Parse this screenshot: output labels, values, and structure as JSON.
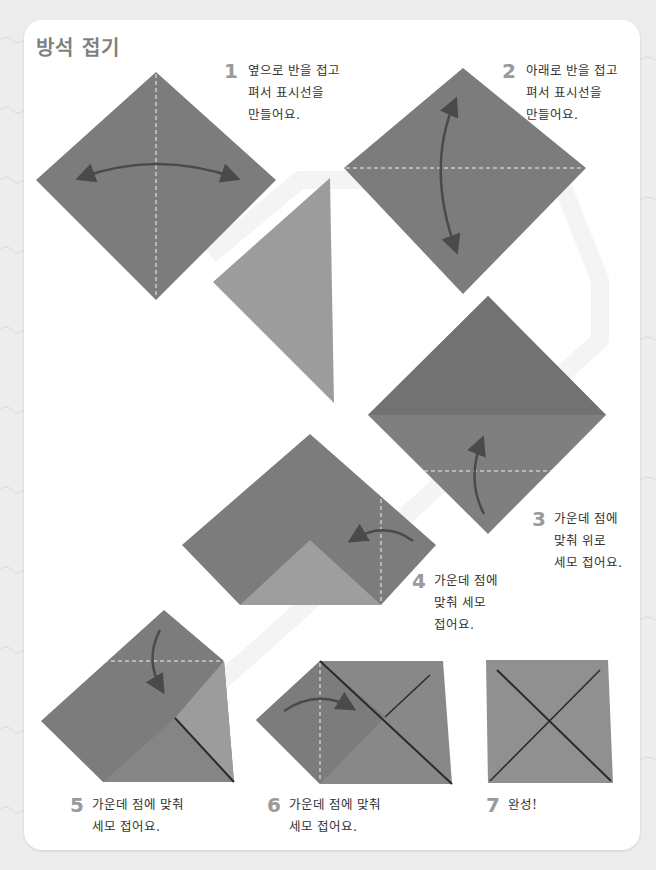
{
  "page": {
    "title": "방석 접기",
    "colors": {
      "background": "#ededed",
      "card": "#ffffff",
      "paper_dark": "#7b7b7b",
      "paper_light": "#9c9c9c",
      "fold_line": "#f2f2f2",
      "arrow": "#4a4a4a",
      "step_number": "#9a9a9a",
      "title": "#7f7f7f"
    }
  },
  "steps": [
    {
      "number": "1",
      "lines": [
        "옆으로 반을 접고",
        "펴서 표시선을",
        "만들어요."
      ]
    },
    {
      "number": "2",
      "lines": [
        "아래로 반을 접고",
        "펴서 표시선을",
        "만들어요."
      ]
    },
    {
      "number": "3",
      "lines": [
        "가운데 점에",
        "맞춰 위로",
        "세모 접어요."
      ]
    },
    {
      "number": "4",
      "lines": [
        "가운데 점에",
        "맞춰 세모",
        "접어요."
      ]
    },
    {
      "number": "5",
      "lines": [
        "가운데 점에 맞춰",
        "세모 접어요."
      ]
    },
    {
      "number": "6",
      "lines": [
        "가운데 점에 맞춰",
        "세모 접어요."
      ]
    },
    {
      "number": "7",
      "lines": [
        "완성!"
      ]
    }
  ]
}
